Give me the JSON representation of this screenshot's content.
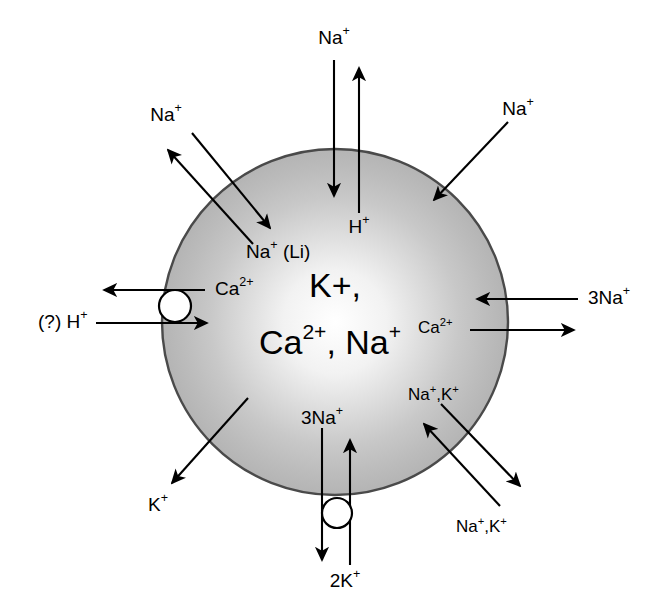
{
  "figure": {
    "type": "cell-membrane-ion-transport-diagram",
    "background_color": "#ffffff",
    "cell": {
      "name": "cell-body",
      "center_x": 335,
      "center_y": 322,
      "radius": 173,
      "fill_center_color": "#ffffff",
      "fill_edge_color": "#b6b6b6",
      "outline_color": "#4a4a4a",
      "interior_labels": [
        {
          "text": "K+",
          "line": 1
        },
        {
          "text": "Ca2+, Na+",
          "line": 2
        }
      ],
      "interior_line1": "K+,",
      "interior_line2_a": "Ca",
      "interior_line2_sup": "2+",
      "interior_line2_b": ", Na",
      "interior_line2_sup2": "+"
    },
    "transporters": [
      {
        "id": "na-h-exchanger",
        "position": "top",
        "outer_label": "Na+",
        "inner_label": "H+",
        "influx_ion": "Na+",
        "efflux_ion": "H+",
        "has_pump_circle": false
      },
      {
        "id": "na-li-countertransport",
        "position": "upper-left",
        "outer_label": "Na+",
        "inner_label": "Na+ (Li)",
        "influx_ion": "Na+",
        "efflux_ion": "Na+ (Li)",
        "has_pump_circle": false
      },
      {
        "id": "na-leak-channel",
        "position": "upper-right",
        "outer_label": "Na+",
        "influx_ion": "Na+",
        "has_pump_circle": false
      },
      {
        "id": "ca-h-atpase",
        "position": "left",
        "efflux_label": "Ca2+",
        "influx_label": "(?) H+",
        "has_pump_circle": true
      },
      {
        "id": "na-ca-exchanger",
        "position": "right",
        "influx_label": "3Na+",
        "efflux_label": "Ca2+",
        "has_pump_circle": false
      },
      {
        "id": "na-k-cotransport",
        "position": "lower-right",
        "influx_label": "Na+,K+",
        "efflux_label": "Na+,K+",
        "has_pump_circle": false
      },
      {
        "id": "k-leak-channel",
        "position": "lower-left",
        "efflux_label": "K+",
        "has_pump_circle": false
      },
      {
        "id": "na-k-atpase",
        "position": "bottom",
        "efflux_label": "3Na+",
        "influx_label": "2K+",
        "has_pump_circle": true
      }
    ],
    "labels": {
      "top_outer": {
        "base": "Na",
        "sup": "+"
      },
      "top_inner": {
        "base": "H",
        "sup": "+"
      },
      "upper_left_outer": {
        "base": "Na",
        "sup": "+"
      },
      "upper_left_inner": {
        "base": "Na",
        "sup": "+",
        "tail": " (Li)"
      },
      "upper_right_outer": {
        "base": "Na",
        "sup": "+"
      },
      "left_ca": {
        "base": "Ca",
        "sup": "2+"
      },
      "left_h": {
        "base": "(?) H",
        "sup": "+"
      },
      "right_3na": {
        "base": "3Na",
        "sup": "+"
      },
      "right_ca": {
        "base": "Ca",
        "sup": "2+"
      },
      "lower_right_inner": {
        "base": "Na",
        "sup": "+",
        "tail": ",K",
        "sup2": "+"
      },
      "lower_right_outer": {
        "base": "Na",
        "sup": "+",
        "tail": ",K",
        "sup2": "+"
      },
      "lower_left_k": {
        "base": "K",
        "sup": "+"
      },
      "bottom_3na": {
        "base": "3Na",
        "sup": "+"
      },
      "bottom_2k": {
        "base": "2K",
        "sup": "+"
      }
    }
  }
}
